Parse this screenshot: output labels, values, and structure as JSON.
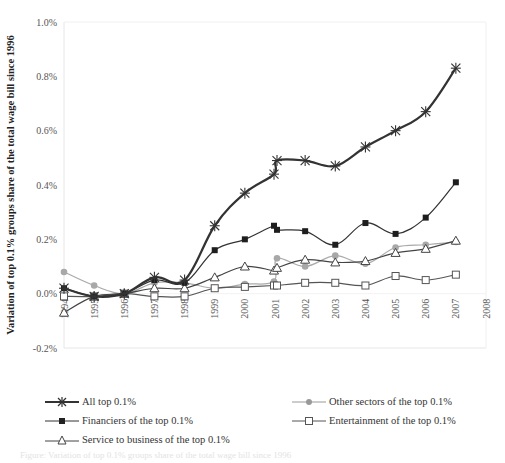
{
  "chart_data": {
    "type": "line",
    "title": "",
    "xlabel": "",
    "ylabel": "Variation of top 0.1% groups share of the total wage bill since 1996",
    "ylim": [
      -0.2,
      1.0
    ],
    "y_unit": "%",
    "y_ticks": [
      "-0.2%",
      "0.0%",
      "0.2%",
      "0.4%",
      "0.6%",
      "0.8%",
      "1.0%"
    ],
    "x_ticks": [
      "1994",
      "1995",
      "1996",
      "1997",
      "1998",
      "1999",
      "2000",
      "2001",
      "2002",
      "2003",
      "2004",
      "2005",
      "2006",
      "2007",
      "2008"
    ],
    "grid": false,
    "legend_position": "bottom",
    "x": [
      1994,
      1995,
      1996,
      1997,
      1998,
      1999,
      2000,
      2001,
      2001,
      2002,
      2003,
      2004,
      2005,
      2006,
      2007
    ],
    "series": [
      {
        "name": "All top 0.1%",
        "marker": "asterisk",
        "color": "#333333",
        "width": 2.2,
        "values": [
          0.02,
          -0.01,
          0.0,
          0.06,
          0.05,
          0.25,
          0.37,
          0.44,
          0.49,
          0.49,
          0.47,
          0.54,
          0.6,
          0.67,
          0.83
        ]
      },
      {
        "name": "Other sectors of the top 0.1%",
        "marker": "circle",
        "color": "#aaaaaa",
        "width": 1.2,
        "values": [
          0.08,
          0.03,
          0.0,
          0.04,
          0.04,
          0.02,
          0.035,
          0.045,
          0.13,
          0.1,
          0.14,
          0.11,
          0.17,
          0.18,
          0.19
        ]
      },
      {
        "name": "Financiers of the top 0.1%",
        "marker": "filled-square",
        "color": "#333333",
        "width": 1.2,
        "values": [
          0.02,
          -0.01,
          0.0,
          0.05,
          0.04,
          0.16,
          0.2,
          0.25,
          0.235,
          0.23,
          0.18,
          0.26,
          0.22,
          0.28,
          0.41
        ]
      },
      {
        "name": "Entertainment of the top 0.1%",
        "marker": "open-square",
        "color": "#555555",
        "width": 1.2,
        "values": [
          -0.01,
          -0.01,
          0.0,
          -0.01,
          -0.01,
          0.02,
          0.025,
          0.03,
          0.03,
          0.04,
          0.04,
          0.03,
          0.065,
          0.05,
          0.07
        ]
      },
      {
        "name": "Service to business of the top 0.1%",
        "marker": "open-triangle",
        "color": "#444444",
        "width": 1.2,
        "values": [
          -0.07,
          -0.01,
          0.0,
          0.02,
          0.02,
          0.06,
          0.1,
          0.085,
          0.095,
          0.125,
          0.115,
          0.12,
          0.15,
          0.165,
          0.195
        ]
      }
    ]
  },
  "legend": {
    "items": [
      {
        "label": "All top 0.1%"
      },
      {
        "label": "Other sectors of the top 0.1%"
      },
      {
        "label": "Financiers of the top 0.1%"
      },
      {
        "label": "Entertainment of the top 0.1%"
      },
      {
        "label": "Service to business of the top 0.1%"
      }
    ]
  },
  "caption": "Figure: Variation of top 0.1% groups share of the total wage bill since 1996"
}
